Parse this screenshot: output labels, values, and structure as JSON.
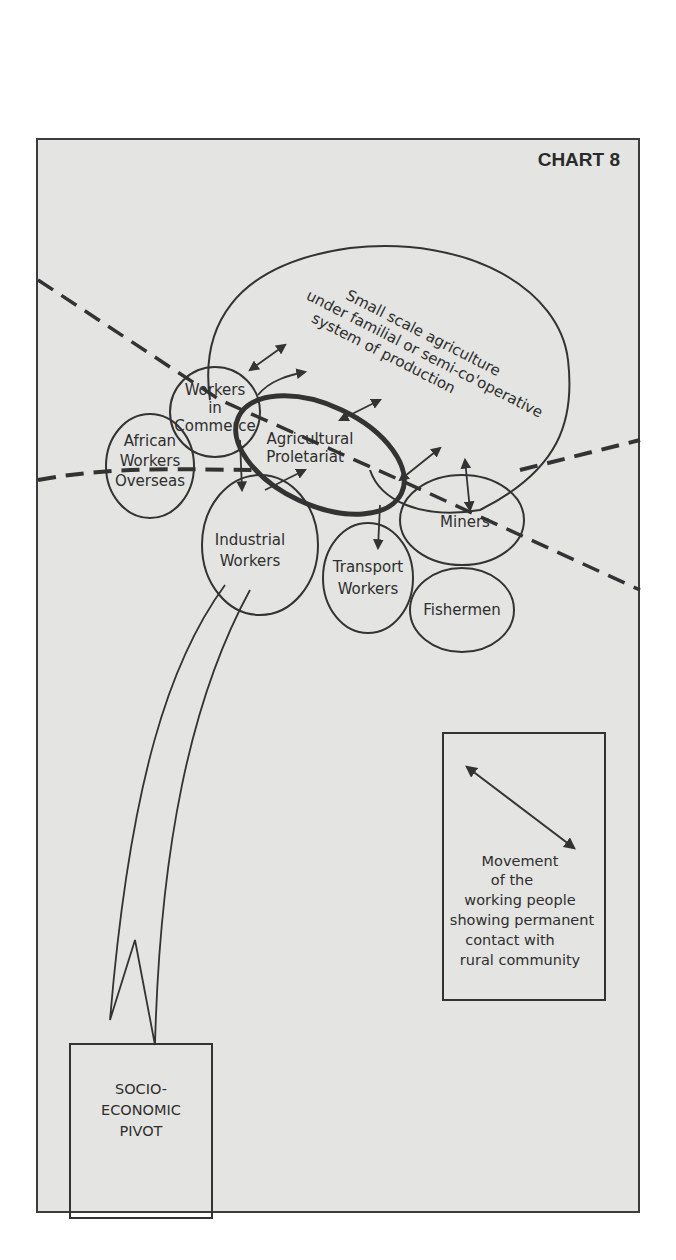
{
  "title": "CHART 8",
  "nodes": [
    {
      "id": "small-scale-agriculture",
      "lines": [
        "Small scale agriculture",
        "under familial or semi-co'operative",
        "system of production"
      ]
    },
    {
      "id": "workers-in-commerce",
      "lines": [
        "Workers",
        "in",
        "Commerce"
      ]
    },
    {
      "id": "african-workers-overseas",
      "lines": [
        "African",
        "Workers",
        "Overseas"
      ]
    },
    {
      "id": "agricultural-proletariat",
      "lines": [
        "Agricultural",
        "Proletariat"
      ]
    },
    {
      "id": "industrial-workers",
      "lines": [
        "Industrial",
        "Workers"
      ]
    },
    {
      "id": "transport-workers",
      "lines": [
        "Transport",
        "Workers"
      ]
    },
    {
      "id": "miners",
      "lines": [
        "Miners"
      ]
    },
    {
      "id": "fishermen",
      "lines": [
        "Fishermen"
      ]
    }
  ],
  "pivot": {
    "lines": [
      "SOCIO-",
      "ECONOMIC",
      "PIVOT"
    ]
  },
  "legend": {
    "lines": [
      "Movement",
      "of the",
      "working people",
      "showing permanent",
      "contact with",
      "rural community"
    ]
  },
  "colors": {
    "ink": "#333333",
    "paper": "#e4e4e2"
  }
}
